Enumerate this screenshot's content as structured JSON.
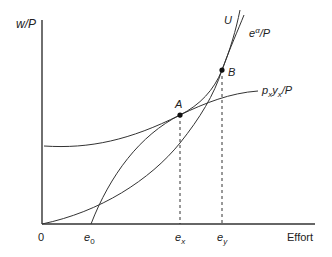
{
  "diagram": {
    "y_axis_label": "w/P",
    "x_axis_label": "Effort",
    "origin_label": "0",
    "x_ticks": [
      {
        "base": "e",
        "sub": "0",
        "x": 91
      },
      {
        "base": "e",
        "sub": "x",
        "x": 180
      },
      {
        "base": "e",
        "sub": "y",
        "x": 222
      }
    ],
    "points": [
      {
        "label": "A",
        "x": 180,
        "y": 115
      },
      {
        "label": "B",
        "x": 222,
        "y": 70
      }
    ],
    "curves": [
      {
        "name": "U",
        "label": "U"
      },
      {
        "name": "effort-cost",
        "label_base": "e",
        "label_sup": "α",
        "label_tail": "/P"
      },
      {
        "name": "revenue",
        "label_p": "p",
        "label_p_sub": "x",
        "label_y": "y",
        "label_y_sub": "x",
        "label_tail": "/P"
      }
    ],
    "colors": {
      "line": "#333333",
      "background": "#ffffff"
    }
  }
}
